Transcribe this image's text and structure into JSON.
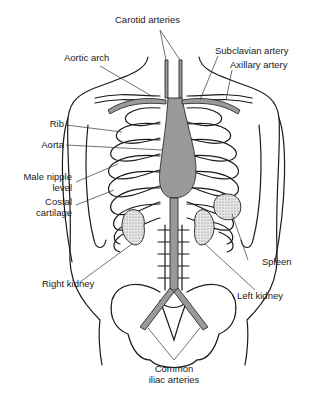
{
  "diagram": {
    "labels": {
      "carotid_arteries": "Carotid arteries",
      "aortic_arch": "Aortic arch",
      "subclavian_artery": "Subclavian artery",
      "axillary_artery": "Axillary artery",
      "rib": "Rib",
      "aorta": "Aorta",
      "male_nipple_level_1": "Male nipple",
      "male_nipple_level_2": "level",
      "costal_cartilage_1": "Costal",
      "costal_cartilage_2": "cartilage",
      "spleen": "Spleen",
      "right_kidney": "Right kidney",
      "left_kidney": "Left kidney",
      "common_iliac_1": "Common",
      "common_iliac_2": "iliac arteries"
    },
    "rib_numbers": [
      "1",
      "2",
      "3",
      "4",
      "5",
      "6",
      "7",
      "8",
      "9",
      "10"
    ],
    "colors": {
      "line": "#1a1a1a",
      "artery_fill": "#9a9a9a",
      "organ_stipple": "#cfcfcf",
      "background": "#ffffff"
    }
  }
}
